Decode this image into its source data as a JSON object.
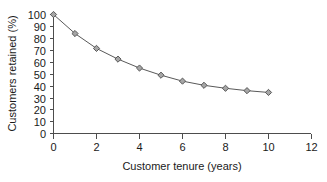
{
  "chart_data": {
    "type": "line",
    "title": "",
    "xlabel": "Customer tenure (years)",
    "ylabel": "Customers retained (%)",
    "x": [
      0,
      1,
      2,
      3,
      4,
      5,
      6,
      7,
      8,
      9,
      10
    ],
    "values": [
      100,
      84,
      71.5,
      62.5,
      55,
      49,
      44,
      40.5,
      38,
      36,
      34.5
    ],
    "series": [
      {
        "name": "Customers retained",
        "values": [
          100,
          84,
          71.5,
          62.5,
          55,
          49,
          44,
          40.5,
          38,
          36,
          34.5
        ]
      }
    ],
    "xlim": [
      0,
      12
    ],
    "ylim": [
      0,
      100
    ],
    "xticks": [
      0,
      2,
      4,
      6,
      8,
      10,
      12
    ],
    "xtick_labels": [
      "0",
      "2",
      "4",
      "6",
      "8",
      "10",
      "12"
    ],
    "yticks": [
      0,
      10,
      20,
      30,
      40,
      50,
      60,
      70,
      80,
      90,
      100
    ],
    "ytick_labels": [
      "0",
      "10",
      "20",
      "30",
      "40",
      "50",
      "60",
      "70",
      "80",
      "90",
      "100"
    ],
    "grid": false,
    "legend": false,
    "marker": "diamond",
    "marker_color": "#a6a6a6",
    "marker_edge_color": "#4d4d4d",
    "line_color": "#595959",
    "background_color": "#ffffff",
    "axis_color": "#4d4d4d"
  }
}
